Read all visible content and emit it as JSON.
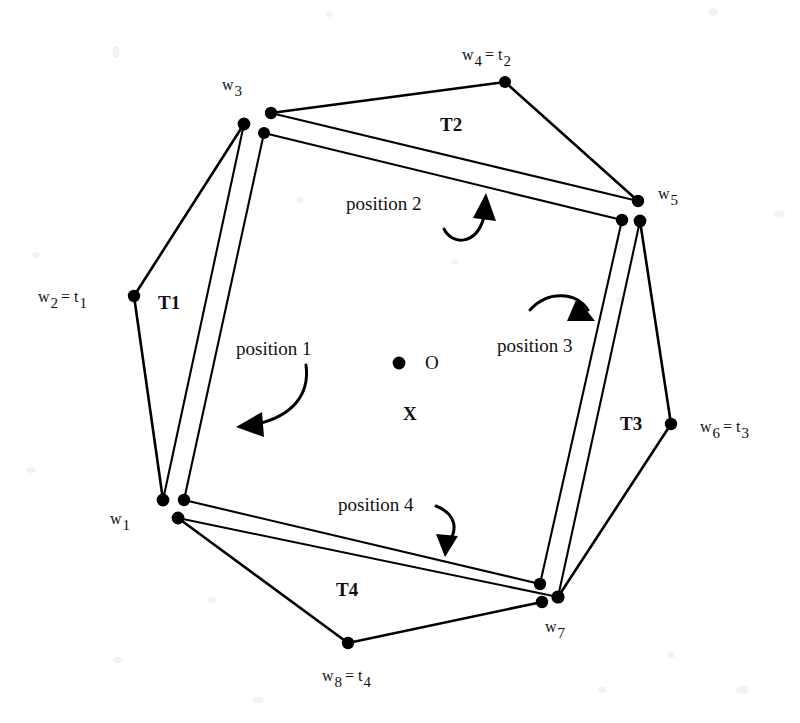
{
  "figure": {
    "center_point_label": "O",
    "center_mark_label": "X",
    "ink_color": "#000000",
    "background_color": "#ffffff"
  },
  "vertices": [
    {
      "id": "w1",
      "base": "w",
      "sub": "1",
      "equals": "",
      "eq_sub": "",
      "label": "w1"
    },
    {
      "id": "w2",
      "base": "w",
      "sub": "2",
      "equals": "= t",
      "eq_sub": "1",
      "label": "w2 = t1"
    },
    {
      "id": "w3",
      "base": "w",
      "sub": "3",
      "equals": "",
      "eq_sub": "",
      "label": "w3"
    },
    {
      "id": "w4",
      "base": "w",
      "sub": "4",
      "equals": "= t",
      "eq_sub": "2",
      "label": "w4 = t2"
    },
    {
      "id": "w5",
      "base": "w",
      "sub": "5",
      "equals": "",
      "eq_sub": "",
      "label": "w5"
    },
    {
      "id": "w6",
      "base": "w",
      "sub": "6",
      "equals": "= t",
      "eq_sub": "3",
      "label": "w6 = t3"
    },
    {
      "id": "w7",
      "base": "w",
      "sub": "7",
      "equals": "",
      "eq_sub": "",
      "label": "w7"
    },
    {
      "id": "w8",
      "base": "w",
      "sub": "8",
      "equals": "= t",
      "eq_sub": "4",
      "label": "w8 = t4"
    }
  ],
  "triangles": [
    {
      "id": "T1",
      "label": "T1"
    },
    {
      "id": "T2",
      "label": "T2"
    },
    {
      "id": "T3",
      "label": "T3"
    },
    {
      "id": "T4",
      "label": "T4"
    }
  ],
  "positions": [
    {
      "id": "position1",
      "label": "position 1"
    },
    {
      "id": "position2",
      "label": "position 2"
    },
    {
      "id": "position3",
      "label": "position 3"
    },
    {
      "id": "position4",
      "label": "position 4"
    }
  ]
}
